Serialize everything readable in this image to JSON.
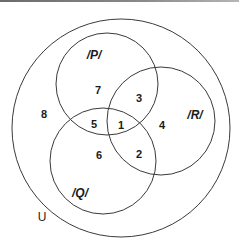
{
  "diagram": {
    "type": "venn",
    "universe": {
      "label": "U",
      "cx": 121,
      "cy": 128,
      "r": 109,
      "label_x": 42,
      "label_y": 221
    },
    "sets": [
      {
        "name": "P",
        "label": "/P/",
        "cx": 107,
        "cy": 84,
        "r": 51,
        "label_x": 94,
        "label_y": 59
      },
      {
        "name": "Q",
        "label": "/Q/",
        "cx": 103,
        "cy": 161,
        "r": 53,
        "label_x": 80,
        "label_y": 197
      },
      {
        "name": "R",
        "label": "/R/",
        "cx": 161,
        "cy": 121,
        "r": 54,
        "label_x": 195,
        "label_y": 119
      }
    ],
    "regions": [
      {
        "id": "1",
        "label": "1",
        "membership": "P∩Q∩R",
        "x": 121,
        "y": 129
      },
      {
        "id": "2",
        "label": "2",
        "membership": "Q∩R only",
        "x": 139,
        "y": 158
      },
      {
        "id": "3",
        "label": "3",
        "membership": "P∩R only",
        "x": 139,
        "y": 102
      },
      {
        "id": "4",
        "label": "4",
        "membership": "R only",
        "x": 162,
        "y": 129
      },
      {
        "id": "5",
        "label": "5",
        "membership": "P∩Q only",
        "x": 94,
        "y": 128
      },
      {
        "id": "6",
        "label": "6",
        "membership": "Q only",
        "x": 99,
        "y": 159
      },
      {
        "id": "7",
        "label": "7",
        "membership": "P only",
        "x": 98,
        "y": 94
      },
      {
        "id": "8",
        "label": "8",
        "membership": "outside P, Q, R",
        "x": 44,
        "y": 118
      }
    ],
    "stroke_color": "#3a3a3a",
    "text_color": "#1a1a1a",
    "background": "#ffffff"
  }
}
